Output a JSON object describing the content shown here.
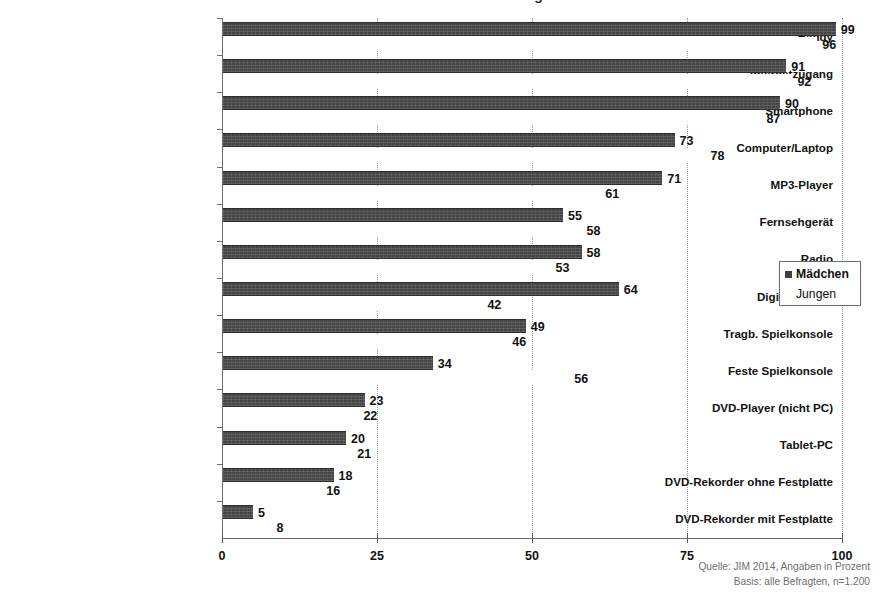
{
  "title_remnant": "Gerätebesitz Jugendlicher 2014",
  "legend": {
    "items": [
      {
        "label": "Mädchen",
        "swatch": "dark-square-icon",
        "color": "#3f3f3f"
      },
      {
        "label": "Jungen",
        "swatch": "white-square-icon",
        "color": "#ffffff"
      }
    ]
  },
  "source": {
    "line1": "Quelle: JIM 2014, Angaben in Prozent",
    "line2": "Basis: alle Befragten, n=1.200"
  },
  "axis": {
    "x_ticks": [
      "0",
      "25",
      "50",
      "75",
      "100"
    ],
    "x_tick_values": [
      0,
      25,
      50,
      75,
      100
    ]
  },
  "chart_data": {
    "type": "bar",
    "orientation": "horizontal",
    "title": "Gerätebesitz Jugendlicher 2014",
    "xlabel": "",
    "ylabel": "",
    "xlim": [
      0,
      100
    ],
    "grid": true,
    "legend_position": "right-middle",
    "unit": "Prozent",
    "categories": [
      "Handy",
      "Internetzugang",
      "Smartphone",
      "Computer/Laptop",
      "MP3-Player",
      "Fernsehgerät",
      "Radio",
      "Digitalkamera",
      "Tragb. Spielkonsole",
      "Feste Spielkonsole",
      "DVD-Player (nicht PC)",
      "Tablet-PC",
      "DVD-Rekorder ohne Festplatte",
      "DVD-Rekorder mit Festplatte"
    ],
    "series": [
      {
        "name": "Mädchen",
        "color": "#454545",
        "values": [
          99,
          91,
          90,
          73,
          71,
          55,
          58,
          64,
          49,
          34,
          23,
          20,
          18,
          5
        ]
      },
      {
        "name": "Jungen",
        "color": "#ffffff",
        "values": [
          96,
          92,
          87,
          78,
          61,
          58,
          53,
          42,
          46,
          56,
          22,
          21,
          16,
          8
        ]
      }
    ]
  }
}
